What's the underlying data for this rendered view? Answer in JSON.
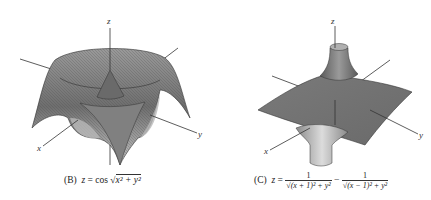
{
  "figures": [
    {
      "id": "B",
      "caption_label": "(B)",
      "caption_formula": "z = cos √(x² + y²)",
      "caption_lhs": "z",
      "caption_eq": "=",
      "caption_fn": "cos",
      "caption_radicand": "x² + y²",
      "axes": {
        "x": "x",
        "y": "y",
        "z": "z"
      }
    },
    {
      "id": "C",
      "caption_label": "(C)",
      "caption_formula": "z = 1/√((x+1)² + y²) − 1/√((x−1)² + y²)",
      "caption_lhs": "z",
      "caption_eq": "=",
      "term1_num": "1",
      "term1_den": "√(x + 1)² + y²",
      "minus": "−",
      "term2_num": "1",
      "term2_den": "√(x − 1)² + y²",
      "axes": {
        "x": "x",
        "y": "y",
        "z": "z"
      }
    }
  ],
  "colors": {
    "surface_dark": "#555555",
    "surface_mid": "#8a8a8a",
    "surface_light": "#c9c9c9",
    "axis": "#333333"
  }
}
